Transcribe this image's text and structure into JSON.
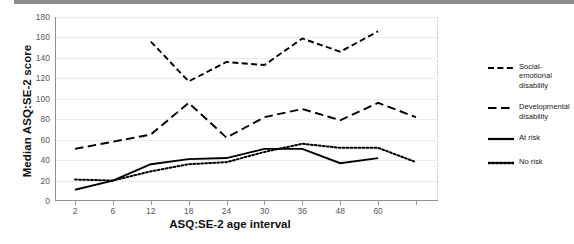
{
  "chart_data": {
    "type": "line",
    "title": "",
    "xlabel": "ASQ:SE-2 age interval",
    "ylabel": "Median ASQ:SE-2 score",
    "categories": [
      "2",
      "6",
      "12",
      "18",
      "24",
      "30",
      "36",
      "48",
      "60",
      ""
    ],
    "ylim": [
      0,
      180
    ],
    "ytick_labels": [
      "0",
      "20",
      "40",
      "60",
      "80",
      "100",
      "120",
      "140",
      "160",
      "180"
    ],
    "ytick_values": [
      0,
      20,
      40,
      60,
      80,
      100,
      120,
      140,
      160,
      180
    ],
    "grid": true,
    "legend_position": "right",
    "series": [
      {
        "name": "Social-emotional disability",
        "style": "dashed",
        "color": "#000000",
        "values": [
          null,
          null,
          156,
          117,
          136,
          133,
          159,
          146,
          166,
          null
        ]
      },
      {
        "name": "Developmental disability",
        "style": "long-dashed",
        "color": "#000000",
        "values": [
          51,
          58,
          65,
          96,
          62,
          82,
          90,
          79,
          96,
          82
        ]
      },
      {
        "name": "At risk",
        "style": "solid",
        "color": "#000000",
        "values": [
          11,
          20,
          36,
          41,
          42,
          51,
          51,
          37,
          42,
          null
        ]
      },
      {
        "name": "No risk",
        "style": "dotted",
        "color": "#000000",
        "values": [
          21,
          20,
          29,
          36,
          38,
          48,
          56,
          52,
          52,
          38
        ]
      }
    ]
  },
  "legend": {
    "items": [
      {
        "label_line1": "Social-emotional",
        "label_line2": "disability"
      },
      {
        "label_line1": "Developmental",
        "label_line2": "disability"
      },
      {
        "label_line1": "At risk",
        "label_line2": ""
      },
      {
        "label_line1": "No risk",
        "label_line2": ""
      }
    ]
  }
}
